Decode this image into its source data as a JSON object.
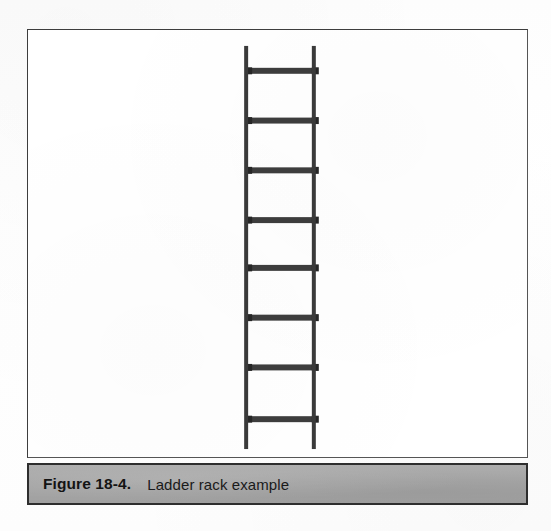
{
  "page": {
    "background_color": "#ffffff",
    "width": 551,
    "height": 531
  },
  "figure": {
    "border_color": "#4a4a4a",
    "background_color": "#ffffff",
    "bounds": {
      "x": 27,
      "y": 29,
      "width": 501,
      "height": 429
    }
  },
  "caption": {
    "label": "Figure 18-4.",
    "text": "Ladder rack example",
    "bar_color": "#a8a8a8",
    "border_color": "#2e2e2e",
    "text_color": "#141414",
    "bounds": {
      "x": 27,
      "y": 463,
      "width": 501,
      "height": 42
    }
  },
  "illustration": {
    "name": "ladder-rack",
    "stroke_color": "#3a3a3a",
    "rung_color": "#3d3d3d",
    "rail_cap_color": "#262626",
    "rails": [
      {
        "name": "left-rail",
        "x": 246,
        "y_top": 45,
        "y_bottom": 450,
        "width": 4
      },
      {
        "name": "right-rail",
        "x": 314,
        "y_top": 45,
        "y_bottom": 450,
        "width": 4
      }
    ],
    "rung_count": 8,
    "rungs": [
      {
        "index": 1,
        "y": 70,
        "thickness": 6
      },
      {
        "index": 2,
        "y": 120,
        "thickness": 6
      },
      {
        "index": 3,
        "y": 170,
        "thickness": 6
      },
      {
        "index": 4,
        "y": 220,
        "thickness": 6
      },
      {
        "index": 5,
        "y": 268,
        "thickness": 6
      },
      {
        "index": 6,
        "y": 318,
        "thickness": 6
      },
      {
        "index": 7,
        "y": 368,
        "thickness": 6
      },
      {
        "index": 8,
        "y": 420,
        "thickness": 6
      }
    ],
    "rung_x_start": 246,
    "rung_x_end": 318
  }
}
